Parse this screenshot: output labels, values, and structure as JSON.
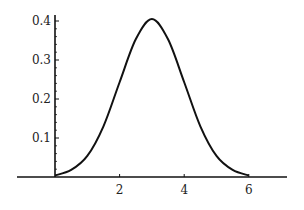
{
  "chart_data": {
    "type": "line",
    "title": "",
    "xlabel": "",
    "ylabel": "",
    "xlim": [
      -1.2,
      7.1
    ],
    "ylim": [
      0,
      0.42
    ],
    "grid": false,
    "legend": null,
    "x_ticks": [
      2,
      4,
      6
    ],
    "x_tick_labels": [
      "2",
      "4",
      "6"
    ],
    "y_ticks": [
      0.1,
      0.2,
      0.3,
      0.4
    ],
    "y_tick_labels": [
      "0.1",
      "0.2",
      "0.3",
      "0.4"
    ],
    "series": [
      {
        "name": "curve",
        "color": "#111111",
        "x": [
          0,
          0.5,
          1,
          1.5,
          2,
          2.5,
          3,
          3.5,
          4,
          4.5,
          5,
          5.5,
          6
        ],
        "values": [
          0.004,
          0.018,
          0.054,
          0.13,
          0.243,
          0.353,
          0.405,
          0.353,
          0.243,
          0.13,
          0.054,
          0.018,
          0.004
        ]
      }
    ]
  },
  "axes": {
    "x_labels": [
      "2",
      "4",
      "6"
    ],
    "y_labels": [
      "0.1",
      "0.2",
      "0.3",
      "0.4"
    ]
  }
}
